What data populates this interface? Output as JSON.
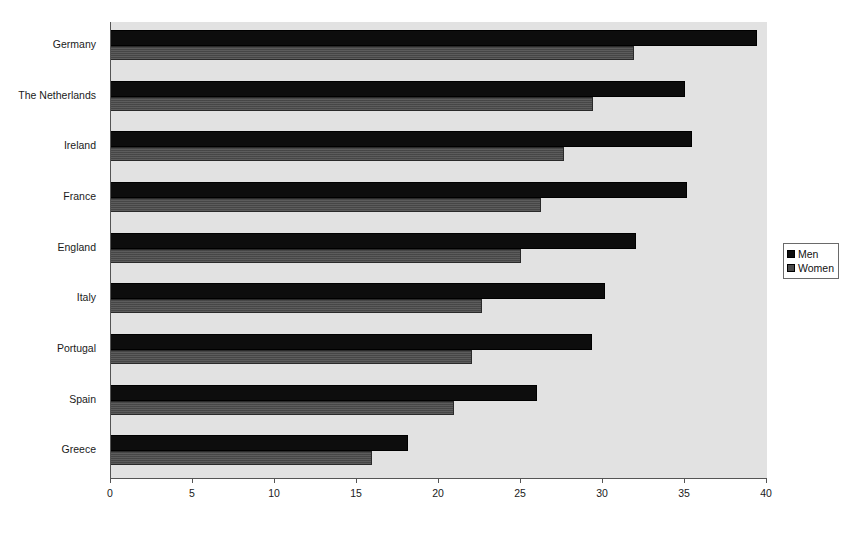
{
  "chart_data": {
    "type": "bar",
    "orientation": "horizontal",
    "title": "",
    "subtitle": "",
    "xlabel": "",
    "ylabel": "",
    "xlim": [
      0,
      40
    ],
    "xticks": [
      0,
      5,
      10,
      15,
      20,
      25,
      30,
      35,
      40
    ],
    "xtick_labels": [
      "0",
      "5",
      "10",
      "15",
      "20",
      "25",
      "30",
      "35",
      "40"
    ],
    "grid": false,
    "legend_position": "right",
    "categories": [
      "Germany",
      "The Netherlands",
      "Ireland",
      "France",
      "England",
      "Italy",
      "Portugal",
      "Spain",
      "Greece"
    ],
    "series": [
      {
        "name": "Men",
        "color": "#0d0d0d",
        "values": [
          39.4,
          35.0,
          35.4,
          35.1,
          32.0,
          30.1,
          29.3,
          26.0,
          18.1
        ]
      },
      {
        "name": "Women",
        "color": "#4a4a4a",
        "values": [
          31.9,
          29.4,
          27.6,
          26.2,
          25.0,
          22.6,
          22.0,
          20.9,
          15.9
        ]
      }
    ]
  },
  "legend": {
    "items": [
      {
        "label": "Men",
        "swatch": "men"
      },
      {
        "label": "Women",
        "swatch": "women"
      }
    ]
  }
}
